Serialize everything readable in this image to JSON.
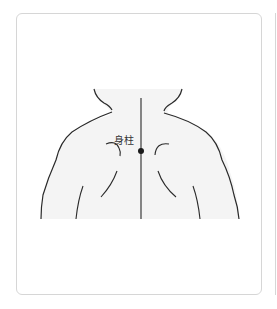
{
  "figure": {
    "acupoint": {
      "label": "身柱",
      "marker": "filled-dot"
    },
    "colors": {
      "outline": "#2a2a2a",
      "skin": "#f4f4f4",
      "card_border": "#d6d6d6",
      "background": "#ffffff"
    }
  }
}
